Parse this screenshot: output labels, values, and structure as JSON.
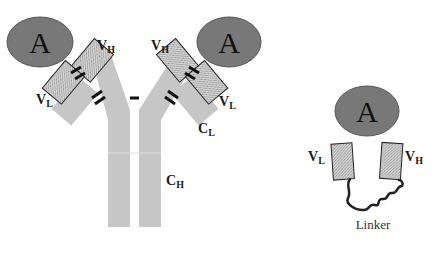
{
  "colors": {
    "antigen_fill": "#777777",
    "antigen_stroke": "#555555",
    "constant_fill": "#c8c8c8",
    "variable_fill": "#d2d2d2",
    "disulfide": "#111111",
    "linker": "#222222"
  },
  "antibody": {
    "antigen_left": {
      "label": "A"
    },
    "antigen_right": {
      "label": "A"
    },
    "label_vh_left": {
      "main": "V",
      "sub": "H"
    },
    "label_vl_left": {
      "main": "V",
      "sub": "L"
    },
    "label_vh_right": {
      "main": "V",
      "sub": "H"
    },
    "label_vl_right": {
      "main": "V",
      "sub": "L"
    },
    "label_cl": {
      "main": "C",
      "sub": "L"
    },
    "label_ch": {
      "main": "C",
      "sub": "H"
    }
  },
  "scfv": {
    "antigen": {
      "label": "A"
    },
    "label_vl": {
      "main": "V",
      "sub": "L"
    },
    "label_vh": {
      "main": "V",
      "sub": "H"
    },
    "linker_label": "Linker"
  }
}
